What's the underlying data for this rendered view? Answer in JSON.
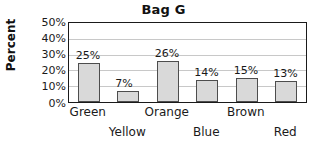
{
  "chart_data": {
    "type": "bar",
    "title": "Bag G",
    "xlabel": "",
    "ylabel": "Percent",
    "categories": [
      "Green",
      "Yellow",
      "Orange",
      "Blue",
      "Brown",
      "Red"
    ],
    "values": [
      25,
      7,
      26,
      14,
      15,
      13
    ],
    "value_labels": [
      "25%",
      "7%",
      "26%",
      "14%",
      "15%",
      "13%"
    ],
    "ylim": [
      0,
      50
    ],
    "ytick_values": [
      0,
      10,
      20,
      30,
      40,
      50
    ],
    "ytick_labels": [
      "50%",
      "40%",
      "30%",
      "20%",
      "10%",
      "0%"
    ],
    "grid": true,
    "legend": "none",
    "bar_color": "#d9d9d9",
    "bar_border_color": "#4d4d4d",
    "gridline_color": "#c8c8c8",
    "axis_color": "#1a1a1a",
    "background_color": "#ffffff",
    "xtick_layout": "staggered-two-rows"
  }
}
